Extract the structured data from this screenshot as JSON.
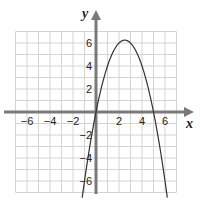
{
  "chart_data": {
    "type": "line",
    "title": "",
    "xlabel": "x",
    "ylabel": "y",
    "xlim": [
      -7,
      7
    ],
    "ylim": [
      -7,
      7
    ],
    "grid": true,
    "x_ticks": [
      -6,
      -4,
      -2,
      2,
      4,
      6
    ],
    "y_ticks": [
      6,
      4,
      2,
      -2,
      -4,
      -6
    ],
    "x_tick_labels": [
      "−6",
      "−4",
      "−2",
      "2",
      "4",
      "6"
    ],
    "y_tick_labels": [
      "6",
      "4",
      "2",
      "−2",
      "−4",
      "−6"
    ],
    "series": [
      {
        "name": "parabola",
        "equation": "y = -x^2 + 5x",
        "x": [
          -1.2,
          -1,
          0,
          1,
          2,
          2.5,
          3,
          4,
          5,
          6,
          6.2
        ],
        "y": [
          -7.44,
          -6,
          0,
          4,
          6,
          6.25,
          6,
          4,
          0,
          -6,
          -7.44
        ],
        "vertex": [
          2.5,
          6.25
        ],
        "roots": [
          0,
          5
        ]
      }
    ],
    "colors": {
      "axis": "#7a7a7a",
      "grid": "#d4d4d4",
      "curve": "#333333"
    }
  },
  "axes": {
    "x_label": "x",
    "y_label": "y"
  }
}
